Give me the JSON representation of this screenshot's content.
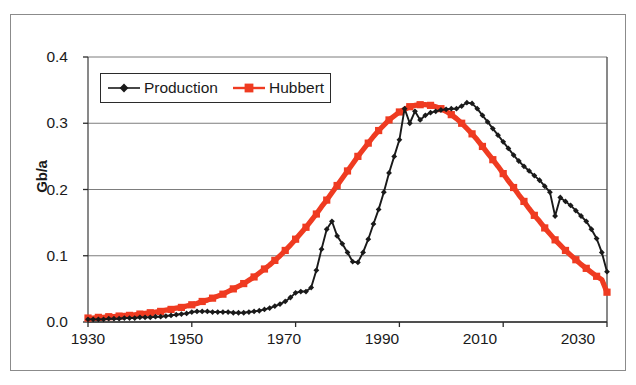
{
  "figure": {
    "kind": "scanned-chart-figure",
    "background_color": "#ffffff",
    "frame_color": "#8b8b8b"
  },
  "axis": {
    "y_title": "Gb/a",
    "y_ticks": [
      "0.4",
      "0.3",
      "0.2",
      "0.1",
      "0.0"
    ],
    "x_ticks": [
      "1930",
      "1950",
      "1970",
      "1990",
      "2010",
      "2030"
    ]
  },
  "legend": {
    "position": "top-left-inside-plot",
    "entries": [
      {
        "label": "Production",
        "color": "#1a1a1a",
        "marker": "diamond-marker"
      },
      {
        "label": "Hubbert",
        "color": "#ef3b21",
        "marker": "square-marker"
      }
    ]
  },
  "chart_data": {
    "type": "line",
    "title": "",
    "xlabel": "",
    "ylabel": "Gb/a",
    "xlim": [
      1930,
      2030
    ],
    "ylim": [
      0.0,
      0.4
    ],
    "xticks": [
      1930,
      1950,
      1970,
      1990,
      2010,
      2030
    ],
    "yticks": [
      0.0,
      0.1,
      0.2,
      0.3,
      0.4
    ],
    "grid": "horizontal",
    "legend_position": "upper-left",
    "series": [
      {
        "name": "Production",
        "color": "#1a1a1a",
        "marker": "diamond",
        "x": [
          1930,
          1931,
          1932,
          1933,
          1934,
          1935,
          1936,
          1937,
          1938,
          1939,
          1940,
          1941,
          1942,
          1943,
          1944,
          1945,
          1946,
          1947,
          1948,
          1949,
          1950,
          1951,
          1952,
          1953,
          1954,
          1955,
          1956,
          1957,
          1958,
          1959,
          1960,
          1961,
          1962,
          1963,
          1964,
          1965,
          1966,
          1967,
          1968,
          1969,
          1970,
          1971,
          1972,
          1973,
          1974,
          1975,
          1976,
          1977,
          1978,
          1979,
          1980,
          1981,
          1982,
          1983,
          1984,
          1985,
          1986,
          1987,
          1988,
          1989,
          1990,
          1991,
          1992,
          1993,
          1994,
          1995,
          1996,
          1997,
          1998,
          1999,
          2000,
          2001,
          2002,
          2003,
          2004,
          2005,
          2006,
          2007,
          2008,
          2009,
          2010,
          2011,
          2012,
          2013,
          2014,
          2015,
          2016,
          2017,
          2018,
          2019,
          2020,
          2021,
          2022,
          2023,
          2024,
          2025,
          2026,
          2027,
          2028,
          2029,
          2030
        ],
        "y": [
          0.004,
          0.004,
          0.004,
          0.004,
          0.005,
          0.005,
          0.005,
          0.006,
          0.006,
          0.006,
          0.007,
          0.007,
          0.007,
          0.008,
          0.008,
          0.009,
          0.01,
          0.011,
          0.012,
          0.013,
          0.015,
          0.016,
          0.016,
          0.016,
          0.015,
          0.015,
          0.015,
          0.015,
          0.014,
          0.014,
          0.014,
          0.015,
          0.016,
          0.017,
          0.019,
          0.021,
          0.024,
          0.027,
          0.031,
          0.037,
          0.044,
          0.046,
          0.046,
          0.052,
          0.078,
          0.11,
          0.14,
          0.152,
          0.13,
          0.118,
          0.105,
          0.091,
          0.09,
          0.105,
          0.125,
          0.148,
          0.17,
          0.196,
          0.225,
          0.25,
          0.275,
          0.322,
          0.3,
          0.318,
          0.305,
          0.312,
          0.316,
          0.318,
          0.32,
          0.321,
          0.322,
          0.322,
          0.326,
          0.331,
          0.33,
          0.322,
          0.312,
          0.302,
          0.292,
          0.282,
          0.272,
          0.262,
          0.252,
          0.243,
          0.235,
          0.228,
          0.221,
          0.214,
          0.205,
          0.196,
          0.16,
          0.188,
          0.182,
          0.176,
          0.168,
          0.16,
          0.152,
          0.14,
          0.126,
          0.105,
          0.076
        ]
      },
      {
        "name": "Hubbert",
        "color": "#ef3b21",
        "marker": "square",
        "x": [
          1930,
          1931,
          1932,
          1933,
          1934,
          1935,
          1936,
          1937,
          1938,
          1939,
          1940,
          1941,
          1942,
          1943,
          1944,
          1945,
          1946,
          1947,
          1948,
          1949,
          1950,
          1951,
          1952,
          1953,
          1954,
          1955,
          1956,
          1957,
          1958,
          1959,
          1960,
          1961,
          1962,
          1963,
          1964,
          1965,
          1966,
          1967,
          1968,
          1969,
          1970,
          1971,
          1972,
          1973,
          1974,
          1975,
          1976,
          1977,
          1978,
          1979,
          1980,
          1981,
          1982,
          1983,
          1984,
          1985,
          1986,
          1987,
          1988,
          1989,
          1990,
          1991,
          1992,
          1993,
          1994,
          1995,
          1996,
          1997,
          1998,
          1999,
          2000,
          2001,
          2002,
          2003,
          2004,
          2005,
          2006,
          2007,
          2008,
          2009,
          2010,
          2011,
          2012,
          2013,
          2014,
          2015,
          2016,
          2017,
          2018,
          2019,
          2020,
          2021,
          2022,
          2023,
          2024,
          2025,
          2026,
          2027,
          2028,
          2029,
          2030
        ],
        "y": [
          0.006,
          0.006,
          0.007,
          0.007,
          0.008,
          0.008,
          0.009,
          0.01,
          0.01,
          0.011,
          0.012,
          0.013,
          0.014,
          0.015,
          0.016,
          0.018,
          0.019,
          0.021,
          0.022,
          0.024,
          0.026,
          0.028,
          0.031,
          0.033,
          0.036,
          0.039,
          0.042,
          0.046,
          0.05,
          0.054,
          0.058,
          0.063,
          0.068,
          0.074,
          0.08,
          0.086,
          0.093,
          0.1,
          0.108,
          0.116,
          0.125,
          0.134,
          0.143,
          0.153,
          0.163,
          0.174,
          0.184,
          0.195,
          0.206,
          0.217,
          0.228,
          0.239,
          0.25,
          0.26,
          0.27,
          0.28,
          0.289,
          0.297,
          0.305,
          0.311,
          0.317,
          0.321,
          0.325,
          0.327,
          0.328,
          0.328,
          0.327,
          0.325,
          0.322,
          0.318,
          0.313,
          0.307,
          0.3,
          0.292,
          0.284,
          0.275,
          0.265,
          0.255,
          0.245,
          0.235,
          0.224,
          0.213,
          0.203,
          0.192,
          0.182,
          0.171,
          0.161,
          0.152,
          0.142,
          0.133,
          0.124,
          0.116,
          0.108,
          0.101,
          0.094,
          0.087,
          0.081,
          0.075,
          0.069,
          0.064,
          0.045
        ]
      }
    ]
  },
  "plot_geometry": {
    "left": 88,
    "right": 607,
    "top": 57,
    "bottom": 322
  }
}
